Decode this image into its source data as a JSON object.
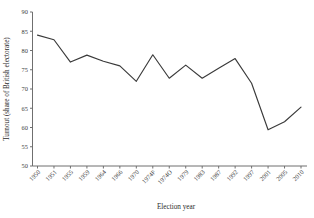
{
  "chart_data": {
    "type": "line",
    "title": "",
    "subtitle": "",
    "xlabel": "Election year",
    "ylabel": "Turnout (share of British electorate)",
    "ylim": [
      50,
      90
    ],
    "yticks": [
      50,
      55,
      60,
      65,
      70,
      75,
      80,
      85,
      90
    ],
    "grid": false,
    "legend": null,
    "legend_position": "none",
    "categories": [
      "1950",
      "1951",
      "1955",
      "1959",
      "1964",
      "1966",
      "1970",
      "1974F",
      "1974O",
      "1979",
      "1983",
      "1987",
      "1992",
      "1997",
      "2001",
      "2005",
      "2010"
    ],
    "values": [
      84.0,
      82.8,
      77.0,
      78.8,
      77.2,
      76.0,
      72.0,
      78.9,
      72.8,
      76.2,
      72.8,
      75.4,
      77.9,
      71.5,
      59.4,
      61.5,
      65.3
    ],
    "series": [
      {
        "name": "Turnout",
        "color": "#3a3a3a",
        "values": [
          84.0,
          82.8,
          77.0,
          78.8,
          77.2,
          76.0,
          72.0,
          78.9,
          72.8,
          76.2,
          72.8,
          75.4,
          77.9,
          71.5,
          59.4,
          61.5,
          65.3
        ]
      }
    ],
    "xtick_labels": [
      "1950",
      "1951",
      "1955",
      "1959",
      "1964",
      "1966",
      "1970",
      "1974F",
      "1974O",
      "1979",
      "1983",
      "1987",
      "1992",
      "1997",
      "2001",
      "2005",
      "2010"
    ],
    "ytick_labels": [
      "50",
      "55",
      "60",
      "65",
      "70",
      "75",
      "80",
      "85",
      "90"
    ]
  },
  "axis": {
    "y_title": "Turnout (share of British electorate)",
    "x_title": "Election year"
  },
  "colors": {
    "line": "#3a3a3a",
    "axis": "#6f6f6f",
    "text": "#3c3c3c",
    "background": "#ffffff"
  }
}
